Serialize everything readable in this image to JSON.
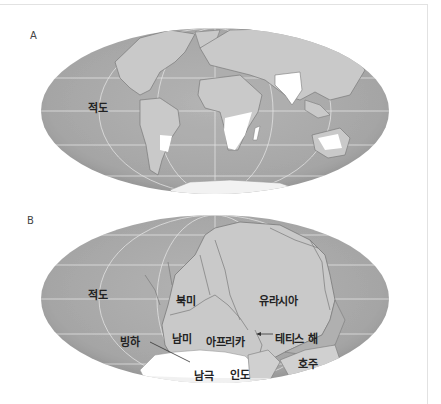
{
  "figure": {
    "panels": [
      {
        "id": "A",
        "letter": "A",
        "description": "Present-day continents (Mollweide projection) with glaciated regions in white",
        "labels": {
          "equator": "적도"
        }
      },
      {
        "id": "B",
        "letter": "B",
        "description": "Pangaea supercontinent with glaciation over Antarctica",
        "labels": {
          "equator": "적도",
          "north_america": "북미",
          "eurasia": "유라시아",
          "south_america": "남미",
          "africa": "아프리카",
          "tethys_sea": "테티스 해",
          "glacier": "빙하",
          "antarctica": "남극",
          "india": "인도",
          "australia": "호주"
        }
      }
    ],
    "colors": {
      "ocean": "#a9a9a9",
      "ocean_edge": "#8f8f8f",
      "land": "#c8c8c8",
      "ice": "#ffffff",
      "gridline": "#e6e6e6",
      "frame": "#e2e2e2"
    }
  }
}
